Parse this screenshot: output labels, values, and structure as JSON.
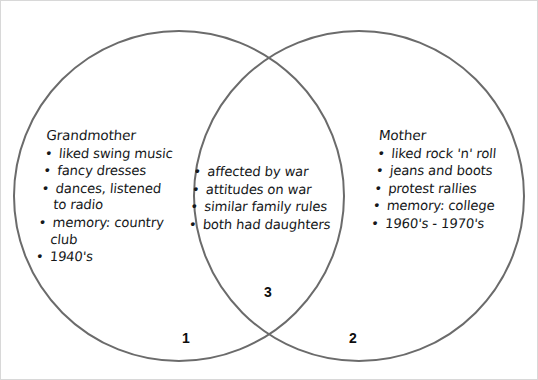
{
  "diagram": {
    "type": "venn-2-set",
    "stroke_color": "#6b6b6b",
    "text_color": "#16181a",
    "background_color": "#ffffff",
    "border_color": "#d8d8d8",
    "circles": [
      {
        "name": "grandmother-circle",
        "cx": 178,
        "cy": 195,
        "r": 165
      },
      {
        "name": "mother-circle",
        "cx": 358,
        "cy": 195,
        "r": 165
      }
    ]
  },
  "left_set": {
    "heading": "Grandmother",
    "items": [
      {
        "line1": "liked swing music",
        "line2": ""
      },
      {
        "line1": "fancy dresses",
        "line2": ""
      },
      {
        "line1": "dances, listened",
        "line2": "to radio"
      },
      {
        "line1": "memory: country",
        "line2": "club"
      },
      {
        "line1": "1940's",
        "line2": ""
      }
    ]
  },
  "intersection_set": {
    "heading": "",
    "items": [
      {
        "line1": "affected by war",
        "line2": ""
      },
      {
        "line1": "attitudes on war",
        "line2": ""
      },
      {
        "line1": "similar family rules",
        "line2": ""
      },
      {
        "line1": "both had daughters",
        "line2": ""
      }
    ]
  },
  "right_set": {
    "heading": "Mother",
    "items": [
      {
        "line1": "liked rock 'n' roll",
        "line2": ""
      },
      {
        "line1": "jeans and boots",
        "line2": ""
      },
      {
        "line1": "protest rallies",
        "line2": ""
      },
      {
        "line1": "memory: college",
        "line2": ""
      },
      {
        "line1": "1960's - 1970's",
        "line2": ""
      }
    ]
  },
  "region_labels": {
    "left_only": "1",
    "right_only": "2",
    "overlap": "3"
  },
  "bullet_glyph": "•"
}
